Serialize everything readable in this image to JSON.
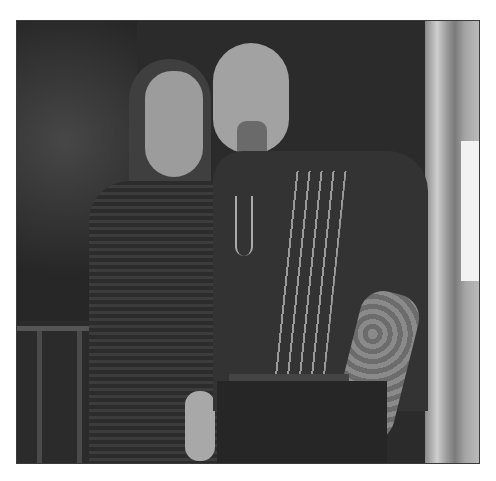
{
  "image": {
    "kind": "photograph",
    "style": "grayscale",
    "description": "Couple posing together in a doorway at night",
    "subjects": [
      {
        "label": "woman",
        "details": "long hair, dark lace top with bell sleeves, standing on left"
      },
      {
        "label": "man",
        "details": "bald with goatee, dark short-sleeve shirt with vertical stripes, pendant necklace, tattooed left arm, hand in pocket"
      }
    ],
    "background": [
      "dark foliage",
      "railing at lower left",
      "light door frame and window at right"
    ]
  }
}
